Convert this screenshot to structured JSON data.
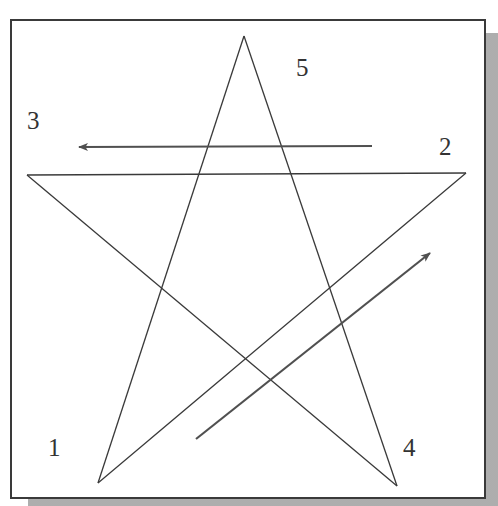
{
  "diagram": {
    "type": "pentagram-stroke-order",
    "stroke_color": "#3a3a3a",
    "arrow_color": "#505050",
    "frame_border": "#3a3a3a",
    "shadow_color": "#bdbdbd",
    "vertices": [
      {
        "id": "1",
        "label": "1",
        "x": 98,
        "y": 483
      },
      {
        "id": "2",
        "label": "2",
        "x": 466,
        "y": 173
      },
      {
        "id": "3",
        "label": "3",
        "x": 27,
        "y": 175
      },
      {
        "id": "4",
        "label": "4",
        "x": 397,
        "y": 486
      },
      {
        "id": "5",
        "label": "5",
        "x": 244,
        "y": 36
      }
    ],
    "labels": [
      {
        "text": "5",
        "x": 296,
        "y": 76
      },
      {
        "text": "3",
        "x": 27,
        "y": 129
      },
      {
        "text": "2",
        "x": 439,
        "y": 155
      },
      {
        "text": "1",
        "x": 48,
        "y": 456
      },
      {
        "text": "4",
        "x": 403,
        "y": 456
      }
    ],
    "arrows": [
      {
        "name": "arrow-toward-3",
        "from": [
          372,
          146
        ],
        "to": [
          77,
          147
        ]
      },
      {
        "name": "arrow-toward-upper-right",
        "from": [
          196,
          439
        ],
        "to": [
          432,
          251
        ]
      }
    ]
  }
}
